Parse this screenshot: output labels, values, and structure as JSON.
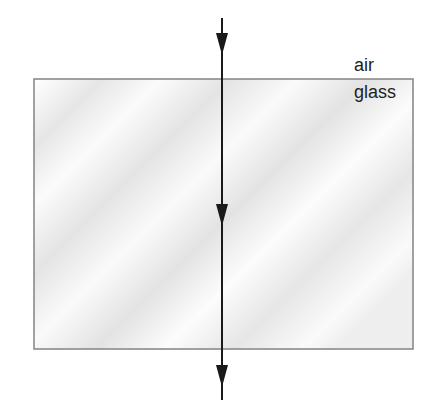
{
  "diagram": {
    "type": "light-ray-refraction",
    "labels": {
      "upper_medium": "air",
      "lower_medium": "glass"
    },
    "glass_block": {
      "x": 34,
      "y": 79,
      "width": 379,
      "height": 270,
      "border_color": "#8a8a8a",
      "fill_color": "#f2f2f2"
    },
    "ray": {
      "x": 222,
      "y_start": 18,
      "y_end": 400,
      "color": "#1a1a1a",
      "direction": "down",
      "incidence": "normal (90 degrees to surface)"
    },
    "arrows": [
      {
        "name": "incident-arrow",
        "y": 45
      },
      {
        "name": "inside-glass-arrow",
        "y": 212
      },
      {
        "name": "emergent-arrow",
        "y": 377
      }
    ]
  }
}
